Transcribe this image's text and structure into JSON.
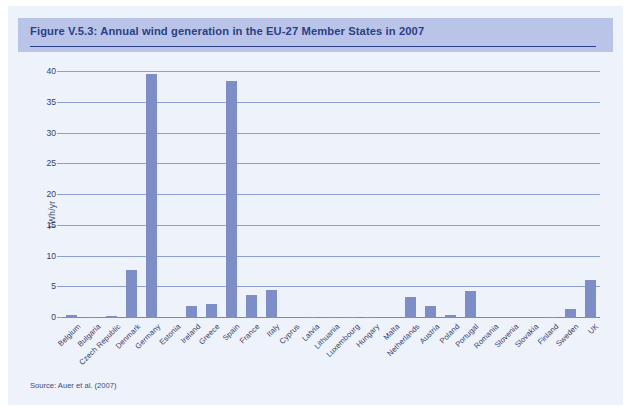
{
  "header": {
    "title": "Figure V.5.3: Annual wind generation in the EU-27 Member States in 2007"
  },
  "footer": {
    "source": "Source: Auer et al. (2007)"
  },
  "colors": {
    "band_background": "#b9c4e8",
    "title_text": "#2b3f86",
    "panel_background": "#eef2fa",
    "bar_fill": "#7c8dc8",
    "gridline": "#8d9ed3",
    "axis_text": "#32406f"
  },
  "chart_data": {
    "type": "bar",
    "title": "Figure V.5.3: Annual wind generation in the EU-27 Member States in 2007",
    "xlabel": "",
    "ylabel": "TWh/yr",
    "ylim": [
      0,
      40
    ],
    "yticks": [
      0,
      5,
      10,
      15,
      20,
      25,
      30,
      35,
      40
    ],
    "grid": true,
    "legend": "none",
    "categories": [
      "Belgium",
      "Bulgaria",
      "Czech Republic",
      "Denmark",
      "Germany",
      "Estonia",
      "Ireland",
      "Greece",
      "Spain",
      "France",
      "Italy",
      "Cyprus",
      "Latvia",
      "Lithuania",
      "Luxembourg",
      "Hungary",
      "Malta",
      "Netherlands",
      "Austria",
      "Poland",
      "Portugal",
      "Romania",
      "Slovenia",
      "Slovakia",
      "Finland",
      "Sweden",
      "UK"
    ],
    "values": [
      0.5,
      0.05,
      0.3,
      7.8,
      39.7,
      0.0,
      2.0,
      2.2,
      38.6,
      3.8,
      4.6,
      0.0,
      0.05,
      0.1,
      0.05,
      0.1,
      0.0,
      3.4,
      1.9,
      0.5,
      4.4,
      0.0,
      0.0,
      0.0,
      0.2,
      1.4,
      6.2
    ]
  }
}
